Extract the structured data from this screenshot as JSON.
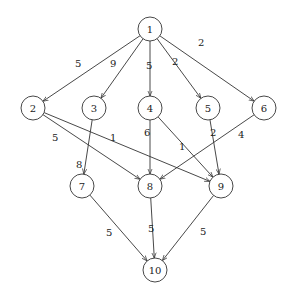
{
  "graph": {
    "nodes": [
      {
        "id": "1",
        "x": 150,
        "y": 29
      },
      {
        "id": "2",
        "x": 33,
        "y": 108
      },
      {
        "id": "3",
        "x": 94,
        "y": 108
      },
      {
        "id": "4",
        "x": 150,
        "y": 108
      },
      {
        "id": "5",
        "x": 208,
        "y": 108
      },
      {
        "id": "6",
        "x": 264,
        "y": 108
      },
      {
        "id": "7",
        "x": 82,
        "y": 186
      },
      {
        "id": "8",
        "x": 150,
        "y": 186
      },
      {
        "id": "9",
        "x": 221,
        "y": 186
      },
      {
        "id": "10",
        "x": 155,
        "y": 270
      }
    ],
    "edges": [
      {
        "from": "1",
        "to": "2",
        "weight": "5",
        "lx": 75,
        "ly": 67
      },
      {
        "from": "1",
        "to": "3",
        "weight": "9",
        "lx": 110,
        "ly": 67
      },
      {
        "from": "1",
        "to": "4",
        "weight": "5",
        "lx": 146,
        "ly": 69
      },
      {
        "from": "1",
        "to": "5",
        "weight": "2",
        "lx": 172,
        "ly": 65
      },
      {
        "from": "1",
        "to": "6",
        "weight": "2",
        "lx": 198,
        "ly": 46
      },
      {
        "from": "2",
        "to": "8",
        "weight": "5",
        "lx": 52,
        "ly": 141
      },
      {
        "from": "2",
        "to": "9",
        "weight": "1",
        "lx": 110,
        "ly": 141
      },
      {
        "from": "3",
        "to": "7",
        "weight": "8",
        "lx": 76,
        "ly": 168
      },
      {
        "from": "4",
        "to": "8",
        "weight": "6",
        "lx": 144,
        "ly": 136
      },
      {
        "from": "4",
        "to": "9",
        "weight": "1",
        "lx": 179,
        "ly": 150
      },
      {
        "from": "5",
        "to": "9",
        "weight": "2",
        "lx": 210,
        "ly": 136
      },
      {
        "from": "6",
        "to": "8",
        "weight": "4",
        "lx": 238,
        "ly": 138
      },
      {
        "from": "7",
        "to": "10",
        "weight": "5",
        "lx": 106,
        "ly": 236
      },
      {
        "from": "8",
        "to": "10",
        "weight": "5",
        "lx": 148,
        "ly": 232
      },
      {
        "from": "9",
        "to": "10",
        "weight": "5",
        "lx": 200,
        "ly": 235
      }
    ]
  }
}
